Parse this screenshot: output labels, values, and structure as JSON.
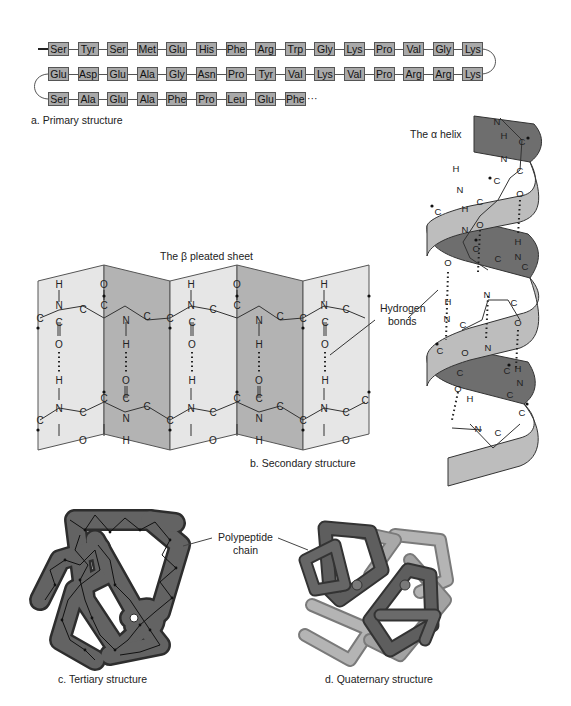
{
  "primary": {
    "caption": "a. Primary structure",
    "rows": [
      [
        "Ser",
        "Tyr",
        "Ser",
        "Met",
        "Glu",
        "His",
        "Phe",
        "Arg",
        "Trp",
        "Gly",
        "Lys",
        "Pro",
        "Val",
        "Gly",
        "Lys"
      ],
      [
        "Glu",
        "Asp",
        "Glu",
        "Ala",
        "Gly",
        "Asn",
        "Pro",
        "Tyr",
        "Val",
        "Lys",
        "Val",
        "Pro",
        "Arg",
        "Arg",
        "Lys"
      ],
      [
        "Ser",
        "Ala",
        "Glu",
        "Ala",
        "Phe",
        "Pro",
        "Leu",
        "Glu",
        "Phe"
      ]
    ],
    "continuation": "···",
    "box_color": "#a9a9a9"
  },
  "secondary": {
    "caption": "b. Secondary structure",
    "beta_title": "The β pleated sheet",
    "alpha_title": "The α helix",
    "hbond_label_line1": "Hydrogen",
    "hbond_label_line2": "bonds",
    "atoms": {
      "h": "H",
      "n": "N",
      "c": "C",
      "o": "O"
    },
    "panel_light": "#e6e6e6",
    "panel_dark": "#b3b3b3",
    "ribbon_light": "#bdbdbd",
    "ribbon_dark": "#6e6e6e"
  },
  "tertiary": {
    "caption": "c. Tertiary structure",
    "chain_label_line1": "Polypeptide",
    "chain_label_line2": "chain",
    "fill": "#5f5f5f"
  },
  "quaternary": {
    "caption": "d. Quaternary structure"
  }
}
